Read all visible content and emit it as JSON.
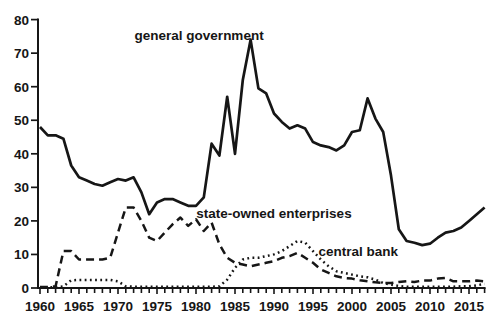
{
  "chart_data": {
    "type": "line",
    "title": "",
    "xlabel": "",
    "ylabel": "",
    "grid": false,
    "legend_position": "inline-annotations",
    "line_color": "#161616",
    "background": "#ffffff",
    "ylim": [
      0,
      80
    ],
    "xlim": [
      1960,
      2017
    ],
    "y_ticks": [
      0,
      10,
      20,
      30,
      40,
      50,
      60,
      70,
      80
    ],
    "x_ticks": [
      1960,
      1965,
      1970,
      1975,
      1980,
      1985,
      1990,
      1995,
      2000,
      2005,
      2010,
      2015
    ],
    "x": [
      1960,
      1961,
      1962,
      1963,
      1964,
      1965,
      1966,
      1967,
      1968,
      1969,
      1970,
      1971,
      1972,
      1973,
      1974,
      1975,
      1976,
      1977,
      1978,
      1979,
      1980,
      1981,
      1982,
      1983,
      1984,
      1985,
      1986,
      1987,
      1988,
      1989,
      1990,
      1991,
      1992,
      1993,
      1994,
      1995,
      1996,
      1997,
      1998,
      1999,
      2000,
      2001,
      2002,
      2003,
      2004,
      2005,
      2006,
      2007,
      2008,
      2009,
      2010,
      2011,
      2012,
      2013,
      2014,
      2015,
      2016,
      2017
    ],
    "series": [
      {
        "name": "general government",
        "style": "solid",
        "values": [
          48,
          45.5,
          45.5,
          44.5,
          36.5,
          33,
          32,
          31,
          30.5,
          31.5,
          32.5,
          32,
          33,
          28.5,
          22,
          25.5,
          26.5,
          26.5,
          25.5,
          24.5,
          24.5,
          27,
          43,
          39.5,
          57,
          40,
          62,
          74,
          59.5,
          58,
          52,
          49.5,
          47.5,
          48.5,
          47.5,
          43.5,
          42.5,
          42,
          41,
          42.5,
          46.5,
          47,
          56.5,
          50.5,
          46.5,
          33.5,
          17.5,
          14,
          13.5,
          12.8,
          13.2,
          15,
          16.5,
          17,
          18,
          20,
          22,
          24
        ]
      },
      {
        "name": "state-owned enterprises",
        "style": "dashed",
        "values": [
          0.3,
          0.3,
          0.5,
          11,
          11,
          8.5,
          8.5,
          8.5,
          8.5,
          9,
          16.5,
          24,
          24,
          20,
          15,
          14,
          16.5,
          19,
          21,
          18.5,
          20.5,
          17,
          19.5,
          13,
          9,
          7.5,
          7,
          6.5,
          7,
          7.5,
          8,
          9,
          9.5,
          10.5,
          9,
          7.5,
          5.5,
          4.5,
          3.5,
          3,
          2.8,
          2.3,
          2,
          1.7,
          1.5,
          1.5,
          1.8,
          2,
          1.8,
          2.2,
          2.2,
          2.8,
          3,
          2,
          2,
          2,
          2.2,
          2
        ]
      },
      {
        "name": "central bank",
        "style": "dotted",
        "values": [
          0.2,
          0.2,
          0.2,
          0.5,
          2.3,
          2.4,
          2.4,
          2.4,
          2.4,
          2.4,
          2,
          0.5,
          0.4,
          0.4,
          0.4,
          0.4,
          0.4,
          0.4,
          0.4,
          0.4,
          0.4,
          0.4,
          0.4,
          0.5,
          2.5,
          6,
          8.5,
          9,
          9,
          9.5,
          10,
          11,
          12.5,
          14,
          13.5,
          11,
          8.5,
          6.5,
          5,
          4.5,
          4,
          3.5,
          3.2,
          2.5,
          1.5,
          1,
          0.6,
          0.4,
          0.4,
          0.4,
          0.4,
          0.4,
          0.4,
          0.4,
          0.5,
          0.5,
          0.8,
          1.2
        ]
      }
    ],
    "annotations": [
      {
        "text": "general government",
        "year": 1980.4,
        "value": 75.5
      },
      {
        "text": "state-owned enterprises",
        "year": 1990,
        "value": 22.5
      },
      {
        "text": "central bank",
        "year": 2000.8,
        "value": 11
      }
    ]
  }
}
